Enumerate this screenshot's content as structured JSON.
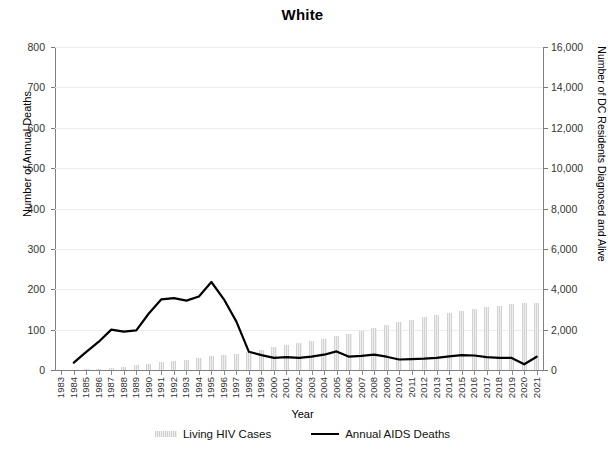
{
  "chart_data": {
    "type": "bar",
    "title": "White",
    "xlabel": "Year",
    "ylabel": "Number of Annual Deaths",
    "y2label": "Number of DC Residents Diagnosed and Alive",
    "ylim": [
      0,
      800
    ],
    "y2lim": [
      0,
      16000
    ],
    "ytick_labels": [
      "800",
      "700",
      "600",
      "500",
      "400",
      "300",
      "200",
      "100",
      "0"
    ],
    "ytick_values": [
      800,
      700,
      600,
      500,
      400,
      300,
      200,
      100,
      0
    ],
    "y2tick_labels": [
      "16,000",
      "14,000",
      "12,000",
      "10,000",
      "8,000",
      "6,000",
      "4,000",
      "2,000",
      "0"
    ],
    "y2tick_values": [
      16000,
      14000,
      12000,
      10000,
      8000,
      6000,
      4000,
      2000,
      0
    ],
    "grid": true,
    "legend_position": "bottom",
    "categories": [
      "1983",
      "1984",
      "1985",
      "1986",
      "1987",
      "1988",
      "1989",
      "1990",
      "1991",
      "1992",
      "1993",
      "1994",
      "1995",
      "1996",
      "1997",
      "1998",
      "1999",
      "2000",
      "2001",
      "2002",
      "2003",
      "2004",
      "2005",
      "2006",
      "2007",
      "2008",
      "2009",
      "2010",
      "2011",
      "2012",
      "2013",
      "2014",
      "2015",
      "2016",
      "2017",
      "2018",
      "2019",
      "2020",
      "2021"
    ],
    "series": [
      {
        "name": "Living HIV Cases",
        "type": "bar",
        "axis": "right",
        "color": "#dcdcdc",
        "values": [
          0,
          0,
          40,
          70,
          110,
          170,
          240,
          310,
          380,
          450,
          520,
          600,
          680,
          740,
          800,
          900,
          1010,
          1130,
          1240,
          1350,
          1450,
          1560,
          1680,
          1800,
          1950,
          2090,
          2230,
          2370,
          2500,
          2620,
          2730,
          2830,
          2930,
          3020,
          3100,
          3180,
          3250,
          3300,
          3330
        ]
      },
      {
        "name": "Annual AIDS Deaths",
        "type": "line",
        "axis": "left",
        "color": "#000000",
        "values": [
          null,
          18,
          45,
          70,
          100,
          95,
          98,
          140,
          175,
          178,
          172,
          182,
          218,
          175,
          120,
          45,
          37,
          30,
          32,
          30,
          33,
          38,
          46,
          33,
          35,
          38,
          33,
          26,
          27,
          28,
          30,
          34,
          37,
          36,
          32,
          30,
          30,
          14,
          33
        ]
      }
    ]
  },
  "legend": {
    "items": [
      {
        "label": "Living HIV Cases",
        "marker": "bar-swatch"
      },
      {
        "label": "Annual AIDS Deaths",
        "marker": "line-swatch"
      }
    ]
  }
}
